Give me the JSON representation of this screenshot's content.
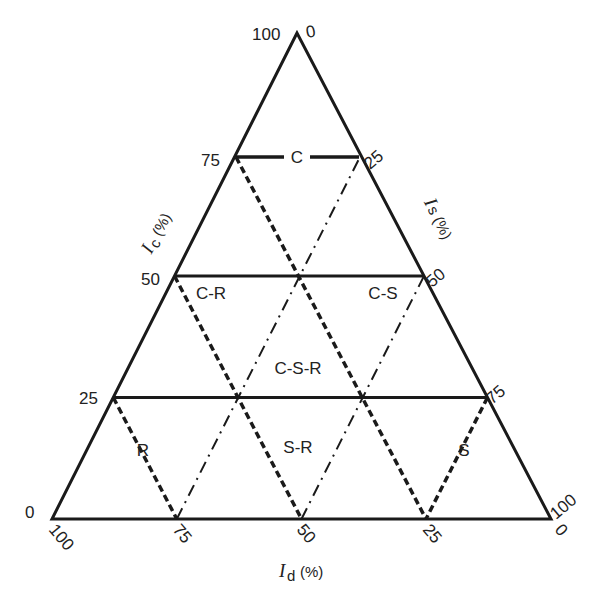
{
  "diagram": {
    "type": "ternary-triangle",
    "top_cut_text": "",
    "axes": {
      "left": {
        "symbol": "I",
        "subscript": "c",
        "unit": "(%)"
      },
      "right": {
        "symbol": "I",
        "subscript": "s",
        "unit": "(%)"
      },
      "bottom": {
        "symbol": "I",
        "subscript": "d",
        "unit": "(%)"
      }
    },
    "ticks": {
      "apex_left": "100",
      "apex_right": "0",
      "left": [
        "75",
        "50",
        "25"
      ],
      "left_bottom": "0",
      "right": [
        "25",
        "50",
        "75"
      ],
      "right_bottom": "100",
      "bottom": [
        "100",
        "75",
        "50",
        "25",
        "0"
      ]
    },
    "regions": {
      "c": "C",
      "cr": "C-R",
      "cs": "C-S",
      "csr": "C-S-R",
      "r": "R",
      "sr": "S-R",
      "s": "S"
    },
    "line_styles": {
      "solid": "horizontal grid at 25/50/75 of Ic",
      "dashed": "parallel to right edge",
      "dash_dot": "parallel to left edge"
    },
    "colors": {
      "line": "#1a1a1a",
      "text": "#222222",
      "background": "#ffffff"
    }
  }
}
